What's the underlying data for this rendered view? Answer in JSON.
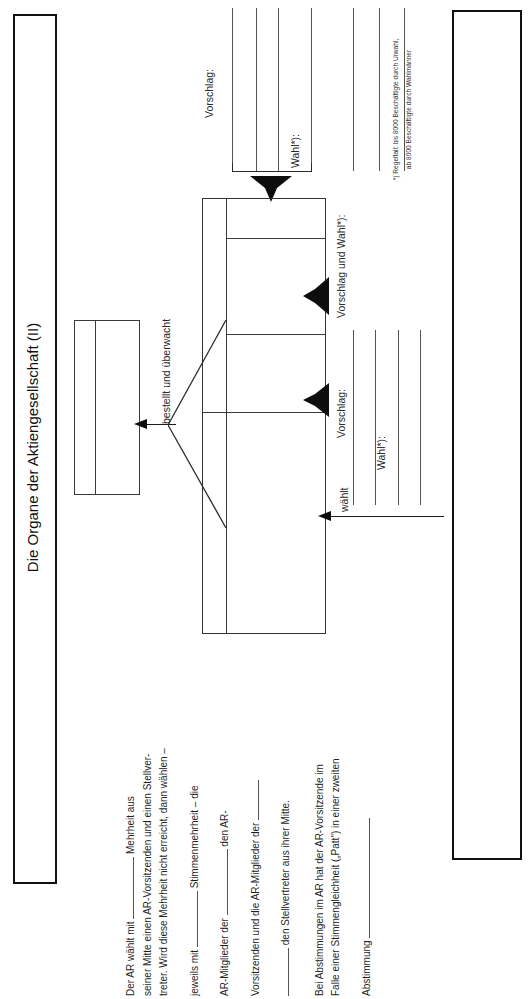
{
  "header": {
    "title": "Die Organe der Aktiengesellschaft (II)"
  },
  "diagram": {
    "top_labels": {
      "vorschlag": "Vorschlag:",
      "wahl": "Wahl*):"
    },
    "middle_labels": {
      "vorschlag_und_wahl": "Vorschlag und Wahl*):",
      "vorschlag": "Vorschlag:"
    },
    "right_labels": {
      "vorschlag": "Vorschlag:",
      "wahl": "Wahl*):"
    },
    "connector_label": "bestellt und überwacht",
    "elects_label": "wählt",
    "footnote_line_1": "*) Regelfall: bis 8000 Beschäftigte durch Urwahl,",
    "footnote_line_2": "ab 8000 Beschäftigte durch Wahlmänner"
  },
  "notes": {
    "lines": [
      "Der AR wählt mit ____________ Mehrheit aus",
      "seiner Mitte einen AR-Vorsitzenden und einen Stellver-",
      "treter. Wird diese Mehrheit nicht erreicht, dann wählen –",
      "jeweils mit ____________ Stimmenmehrheit – die",
      "AR-Mitglieder der ____________ den AR-",
      "Vorsitzenden und die AR-Mitglieder der ____________",
      "____________ den Stellvertreter aus ihrer Mitte.",
      "Bei Abstimmungen im AR hat der AR-Vorsitzende im",
      "Falle einer Stimmengleichheit („Patt\") in einer zweiten",
      "Abstimmung ____________"
    ],
    "line_1_a": "Der AR wählt mit",
    "line_1_b": "Mehrheit aus",
    "line_2": "seiner Mitte einen AR-Vorsitzenden und einen Stellver-",
    "line_3": "treter. Wird diese Mehrheit nicht erreicht, dann wählen –",
    "line_4_a": "jeweils mit",
    "line_4_b": "Stimmenmehrheit – die",
    "line_5_a": "AR-Mitglieder der",
    "line_5_b": "den AR-",
    "line_6_a": "Vorsitzenden und die AR-Mitglieder der",
    "line_7": "den Stellvertreter aus ihrer Mitte.",
    "line_8": "Bei Abstimmungen im AR hat der AR-Vorsitzende im",
    "line_9": "Falle einer Stimmengleichheit („Patt\") in einer zweiten",
    "line_10": "Abstimmung"
  }
}
